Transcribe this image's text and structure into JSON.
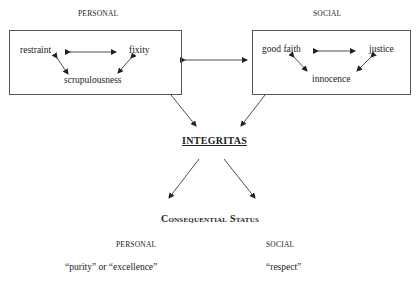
{
  "personal_group": {
    "heading": "PERSONAL",
    "items": [
      "restraint",
      "fixity",
      "scrupulousness"
    ]
  },
  "social_group": {
    "heading": "SOCIAL",
    "items": [
      "good faith",
      "justice",
      "innocence"
    ]
  },
  "center": {
    "title": "INTEGRITAS"
  },
  "consequential": {
    "title": "Consequential Status",
    "personal_heading": "PERSONAL",
    "personal_value": "“purity” or “excellence”",
    "social_heading": "SOCIAL",
    "social_value": "“respect”"
  }
}
